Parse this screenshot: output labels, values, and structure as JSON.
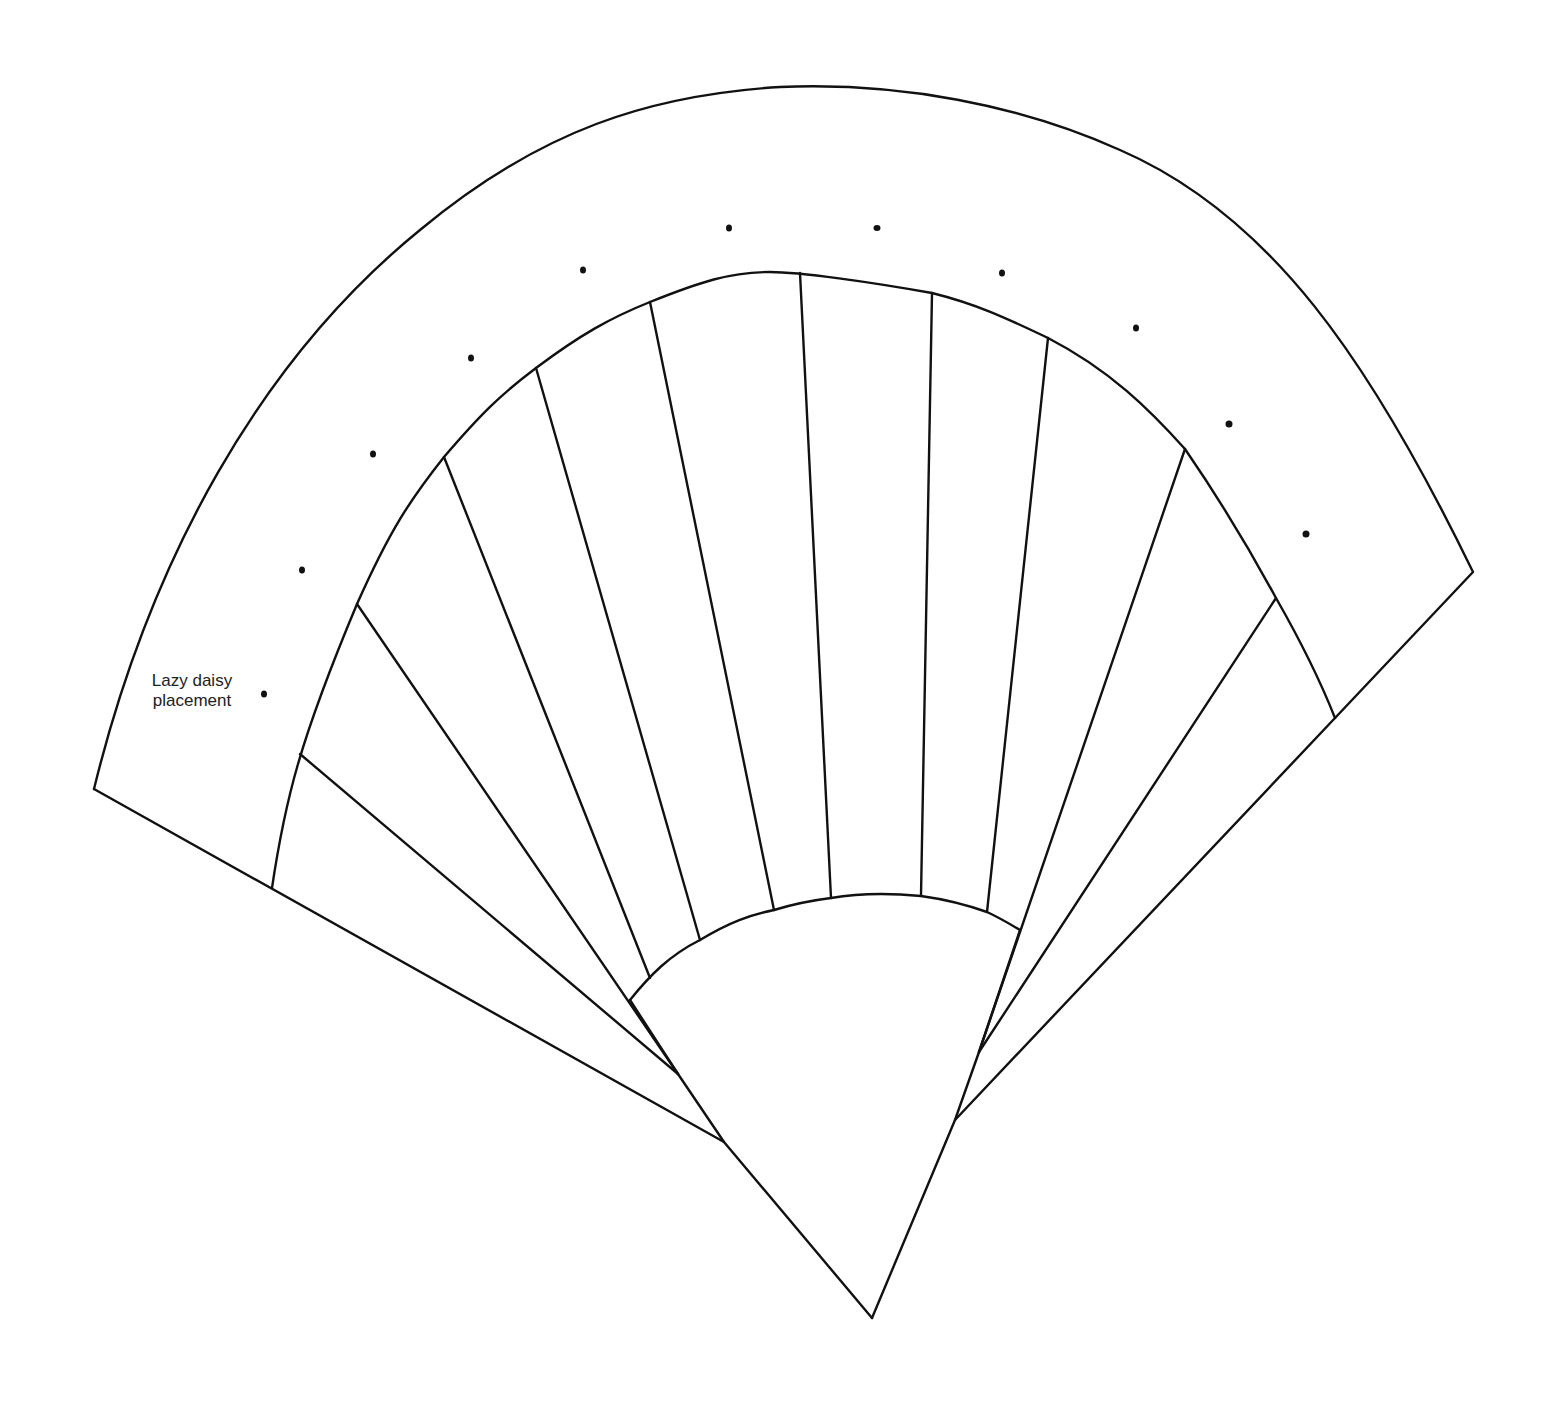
{
  "diagram": {
    "title": "",
    "annotation": {
      "line1": "Lazy daisy",
      "line2": "placement"
    },
    "colors": {
      "stroke": "#111111",
      "background": "#ffffff",
      "text": "#222222"
    },
    "shapes": {
      "outer_band": "fan-shaped outer border band",
      "inner_blades": "radiating fan blade segments",
      "center_dome": "quarter-circle fan base"
    },
    "stitch_dots_count": 12
  }
}
